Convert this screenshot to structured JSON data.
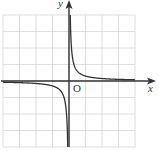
{
  "chart_data": {
    "type": "line",
    "title": "",
    "xlabel": "x",
    "ylabel": "y",
    "origin_label": "O",
    "function": "y = k/x (reciprocal, k>0)",
    "xlim": [
      -4,
      4
    ],
    "ylim": [
      -4,
      4
    ],
    "grid": true,
    "series": [
      {
        "name": "branch-positive",
        "x": [
          0.08,
          0.1,
          0.2,
          0.5,
          1,
          2,
          3,
          4
        ],
        "y": [
          3.75,
          3.0,
          1.5,
          0.6,
          0.3,
          0.15,
          0.1,
          0.075
        ]
      },
      {
        "name": "branch-negative",
        "x": [
          -4,
          -3,
          -2,
          -1,
          -0.5,
          -0.2,
          -0.1,
          -0.08
        ],
        "y": [
          -0.075,
          -0.1,
          -0.15,
          -0.3,
          -0.6,
          -1.5,
          -3.0,
          -3.75
        ]
      }
    ],
    "colors": {
      "grid": "#d6d6d6",
      "axis": "#333333",
      "curve": "#333333"
    }
  }
}
